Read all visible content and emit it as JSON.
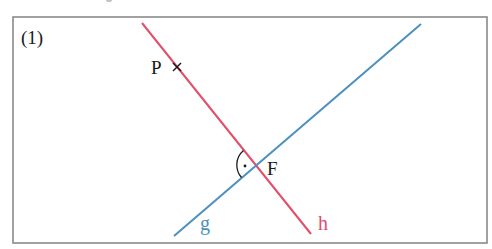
{
  "figure": {
    "label": "(1)",
    "frame": {
      "x1": 13,
      "y1": 17,
      "x2": 487,
      "y2": 243,
      "color": "#8a8a8a"
    }
  },
  "lines": [
    {
      "name": "g",
      "label": "g",
      "color": "#4a90c0",
      "from": [
        174,
        236
      ],
      "to": [
        421,
        24
      ],
      "label_pos": [
        200,
        213
      ]
    },
    {
      "name": "h",
      "label": "h",
      "color": "#e0506a",
      "from": [
        142,
        23
      ],
      "to": [
        311,
        234
      ],
      "label_pos": [
        318,
        213
      ]
    }
  ],
  "points": [
    {
      "name": "P",
      "label": "P",
      "marker": "cross",
      "pos": [
        177,
        67
      ],
      "label_pos": [
        151,
        57
      ]
    },
    {
      "name": "F",
      "label": "F",
      "marker": "intersection",
      "pos": [
        256,
        165
      ],
      "label_pos": [
        267,
        158
      ]
    }
  ],
  "right_angle": {
    "at": "F",
    "symbol": "arc-with-dot",
    "arc_center": [
      256,
      165
    ],
    "dot": [
      245,
      166
    ]
  },
  "colors": {
    "text": "#1a1a1a",
    "g": "#4a90c0",
    "h": "#e0506a"
  }
}
